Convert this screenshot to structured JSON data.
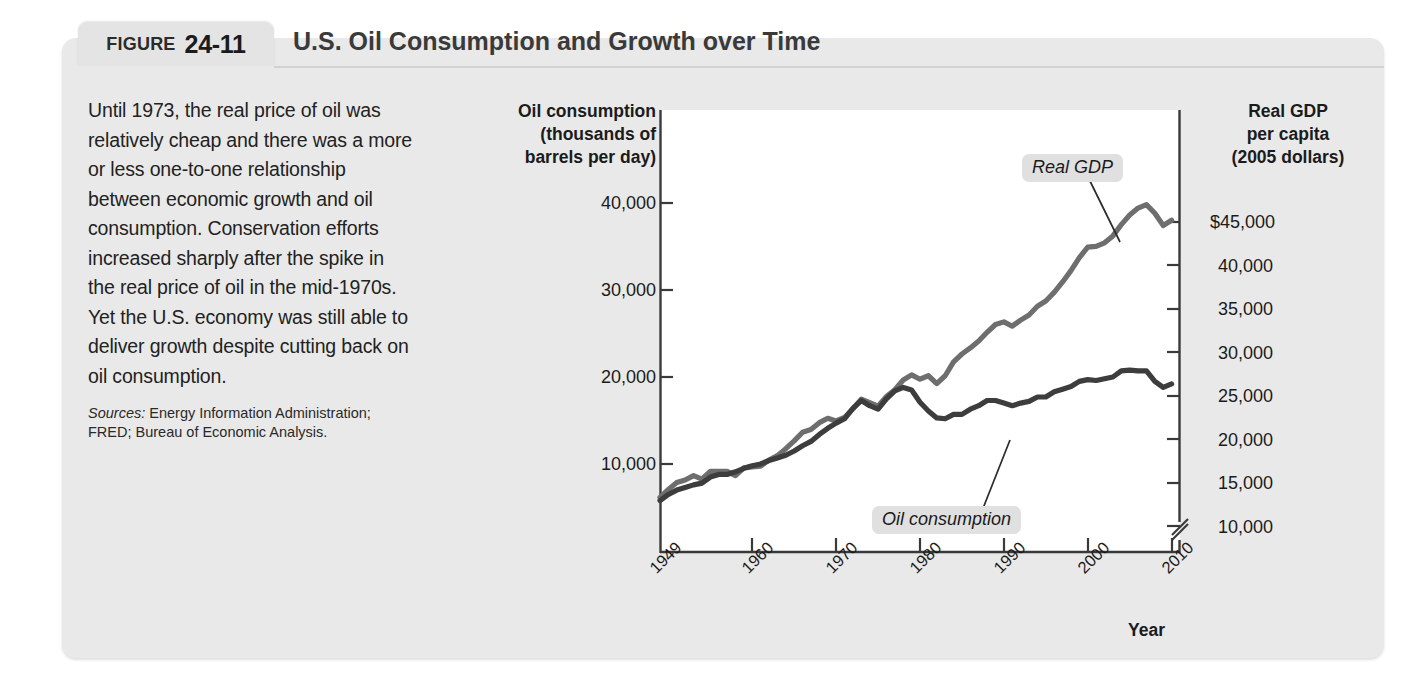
{
  "figure": {
    "tab_word": "FIGURE",
    "tab_number": "24-11",
    "title": "U.S. Oil Consumption and Growth over Time"
  },
  "description": {
    "body": "Until 1973, the real price of oil was relatively cheap and there was a more or less one-to-one relationship between economic growth and oil consumption. Conservation efforts increased sharply after the spike in the real price of oil in the mid-1970s. Yet the U.S. economy was still able to deliver growth despite cutting back on oil consumption.",
    "sources_label": "Sources:",
    "sources_text": " Energy Information Administration; FRED; Bureau of Economic Analysis."
  },
  "chart_data": {
    "type": "line",
    "title": "U.S. Oil Consumption and Growth over Time",
    "xlabel": "Year",
    "left_axis": {
      "label": "Oil consumption (thousands of barrels per day)",
      "label_lines": [
        "Oil consumption",
        "(thousands of",
        "barrels per day)"
      ],
      "ticks": [
        10000,
        20000,
        30000,
        40000
      ],
      "tick_labels": [
        "10,000",
        "20,000",
        "30,000",
        "40,000"
      ],
      "range": [
        0,
        50000
      ]
    },
    "right_axis": {
      "label": "Real GDP per capita (2005 dollars)",
      "label_lines": [
        "Real GDP",
        "per capita",
        "(2005 dollars)"
      ],
      "ticks": [
        10000,
        15000,
        20000,
        25000,
        30000,
        35000,
        40000,
        45000
      ],
      "tick_labels": [
        "10,000",
        "15,000",
        "20,000",
        "25,000",
        "30,000",
        "35,000",
        "40,000",
        "$45,000"
      ],
      "range": [
        5000,
        50000
      ],
      "axis_break": true
    },
    "x_ticks": [
      1949,
      1960,
      1970,
      1980,
      1990,
      2000,
      2010
    ],
    "x_tick_labels": [
      "1949",
      "1960",
      "1970",
      "1980",
      "1990",
      "2000",
      "2010"
    ],
    "xlim": [
      1949,
      2011
    ],
    "grid": false,
    "legend_position": "inline-callout",
    "series": [
      {
        "name": "Real GDP",
        "callout_label": "Real GDP",
        "color": "#6e6e6e",
        "axis": "right",
        "units": "2005 dollars per capita",
        "x": [
          1949,
          1950,
          1951,
          1952,
          1953,
          1954,
          1955,
          1956,
          1957,
          1958,
          1959,
          1960,
          1961,
          1962,
          1963,
          1964,
          1965,
          1966,
          1967,
          1968,
          1969,
          1970,
          1971,
          1972,
          1973,
          1974,
          1975,
          1976,
          1977,
          1978,
          1979,
          1980,
          1981,
          1982,
          1983,
          1984,
          1985,
          1986,
          1987,
          1988,
          1989,
          1990,
          1991,
          1992,
          1993,
          1994,
          1995,
          1996,
          1997,
          1998,
          1999,
          2000,
          2001,
          2002,
          2003,
          2004,
          2005,
          2006,
          2007,
          2008,
          2009,
          2010
        ],
        "values": [
          13300,
          14200,
          15000,
          15300,
          15800,
          15400,
          16300,
          16300,
          16300,
          15800,
          16700,
          16800,
          16900,
          17600,
          18100,
          18900,
          19800,
          20800,
          21100,
          21900,
          22400,
          22100,
          22500,
          23500,
          24600,
          24200,
          23800,
          24900,
          25700,
          26800,
          27400,
          26900,
          27300,
          26400,
          27300,
          28900,
          29800,
          30500,
          31300,
          32300,
          33200,
          33500,
          33000,
          33700,
          34300,
          35300,
          35900,
          36900,
          38100,
          39400,
          40900,
          42100,
          42200,
          42600,
          43400,
          44700,
          45800,
          46600,
          47000,
          46000,
          44600,
          45200
        ]
      },
      {
        "name": "Oil consumption",
        "callout_label": "Oil consumption",
        "color": "#3d3d3d",
        "axis": "left",
        "units": "thousands of barrels per day",
        "x": [
          1949,
          1950,
          1951,
          1952,
          1953,
          1954,
          1955,
          1956,
          1957,
          1958,
          1959,
          1960,
          1961,
          1962,
          1963,
          1964,
          1965,
          1966,
          1967,
          1968,
          1969,
          1970,
          1971,
          1972,
          1973,
          1974,
          1975,
          1976,
          1977,
          1978,
          1979,
          1980,
          1981,
          1982,
          1983,
          1984,
          1985,
          1986,
          1987,
          1988,
          1989,
          1990,
          1991,
          1992,
          1993,
          1994,
          1995,
          1996,
          1997,
          1998,
          1999,
          2000,
          2001,
          2002,
          2003,
          2004,
          2005,
          2006,
          2007,
          2008,
          2009,
          2010
        ],
        "values": [
          5800,
          6500,
          7000,
          7300,
          7600,
          7800,
          8500,
          8800,
          8800,
          9100,
          9500,
          9800,
          10000,
          10400,
          10700,
          11000,
          11500,
          12100,
          12600,
          13400,
          14100,
          14700,
          15200,
          16400,
          17300,
          16700,
          16300,
          17500,
          18400,
          18800,
          18500,
          17100,
          16100,
          15300,
          15200,
          15700,
          15700,
          16300,
          16700,
          17300,
          17300,
          17000,
          16700,
          17000,
          17200,
          17700,
          17700,
          18300,
          18600,
          18900,
          19500,
          19700,
          19600,
          19800,
          20000,
          20700,
          20800,
          20700,
          20700,
          19500,
          18800,
          19200
        ]
      }
    ],
    "annotations": [
      {
        "text": "Real GDP",
        "points_to_year": 1997,
        "style": "italic-pill"
      },
      {
        "text": "Oil consumption",
        "points_to_year": 1990,
        "style": "italic-pill"
      }
    ]
  }
}
